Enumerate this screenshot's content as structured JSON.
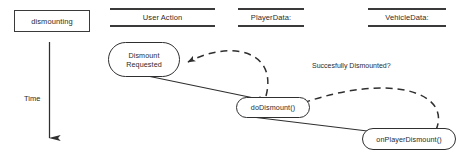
{
  "diagram": {
    "title_state": "dismounting",
    "time_axis": {
      "label": "Time",
      "direction": "down"
    },
    "columns": [
      {
        "id": "user-action",
        "label": "User Action"
      },
      {
        "id": "player-data",
        "label": "PlayerData:"
      },
      {
        "id": "vehicle-data",
        "label": "VehicleData:"
      }
    ],
    "nodes": [
      {
        "id": "dismount-requested",
        "line1": "Dismount",
        "line2": "Requested",
        "column": "user-action"
      },
      {
        "id": "do-dismount",
        "line1": "doDismount()",
        "line2": "",
        "column": "player-data"
      },
      {
        "id": "on-player-dismount",
        "line1": "onPlayerDismount()",
        "line2": "",
        "column": "vehicle-data"
      }
    ],
    "edges": [
      {
        "id": "req-to-do",
        "from": "dismount-requested",
        "to": "do-dismount",
        "style": "solid",
        "label": ""
      },
      {
        "id": "do-to-on",
        "from": "do-dismount",
        "to": "on-player-dismount",
        "style": "solid",
        "label": ""
      },
      {
        "id": "do-to-req",
        "from": "do-dismount",
        "to": "dismount-requested",
        "style": "dashed",
        "label": ""
      },
      {
        "id": "on-to-do",
        "from": "on-player-dismount",
        "to": "do-dismount",
        "style": "dashed",
        "label": "Succesfully Dismounted?"
      }
    ],
    "colors": {
      "stroke": "#2f2f2f",
      "text": "#2b2b2b",
      "background": "#ffffff"
    }
  }
}
